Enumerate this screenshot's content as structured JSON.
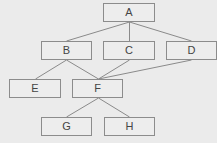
{
  "diagram": {
    "type": "hierarchy",
    "colors": {
      "background": "#ebebeb",
      "node_fill": "#ededed",
      "node_border": "#8c8c8c",
      "edge": "#8a8a8a",
      "text": "#444444"
    },
    "nodes": [
      {
        "id": "A",
        "label": "A",
        "x": 103,
        "y": 3,
        "w": 52,
        "h": 19
      },
      {
        "id": "B",
        "label": "B",
        "x": 41,
        "y": 41,
        "w": 51,
        "h": 19
      },
      {
        "id": "C",
        "label": "C",
        "x": 103,
        "y": 41,
        "w": 52,
        "h": 19
      },
      {
        "id": "D",
        "label": "D",
        "x": 166,
        "y": 41,
        "w": 51,
        "h": 19
      },
      {
        "id": "E",
        "label": "E",
        "x": 9,
        "y": 79,
        "w": 52,
        "h": 19
      },
      {
        "id": "F",
        "label": "F",
        "x": 72,
        "y": 79,
        "w": 51,
        "h": 19
      },
      {
        "id": "G",
        "label": "G",
        "x": 41,
        "y": 117,
        "w": 51,
        "h": 19
      },
      {
        "id": "H",
        "label": "H",
        "x": 104,
        "y": 117,
        "w": 51,
        "h": 19
      }
    ],
    "edges": [
      {
        "from": "A",
        "to": "B",
        "x1": 129,
        "y1": 22,
        "x2": 66,
        "y2": 41
      },
      {
        "from": "A",
        "to": "C",
        "x1": 129,
        "y1": 22,
        "x2": 129,
        "y2": 41
      },
      {
        "from": "A",
        "to": "D",
        "x1": 129,
        "y1": 22,
        "x2": 191,
        "y2": 41
      },
      {
        "from": "B",
        "to": "E",
        "x1": 66,
        "y1": 60,
        "x2": 35,
        "y2": 79
      },
      {
        "from": "B",
        "to": "F",
        "x1": 66,
        "y1": 60,
        "x2": 98,
        "y2": 79
      },
      {
        "from": "C",
        "to": "F",
        "x1": 129,
        "y1": 60,
        "x2": 98,
        "y2": 79
      },
      {
        "from": "D",
        "to": "F",
        "x1": 191,
        "y1": 60,
        "x2": 98,
        "y2": 79
      },
      {
        "from": "F",
        "to": "G",
        "x1": 98,
        "y1": 98,
        "x2": 66,
        "y2": 117
      },
      {
        "from": "F",
        "to": "H",
        "x1": 98,
        "y1": 98,
        "x2": 129,
        "y2": 117
      }
    ]
  }
}
